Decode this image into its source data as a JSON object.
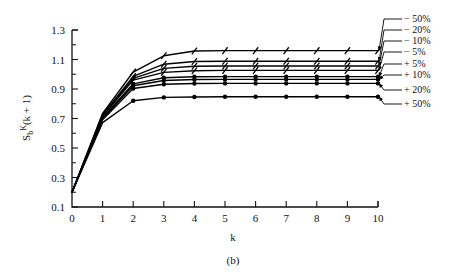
{
  "caption": "(b)",
  "chart_data": {
    "type": "line",
    "title": "",
    "xlabel": "k",
    "ylabel": "Sᵦᴷ(k + 1)",
    "ylabel_parts": {
      "base": "S",
      "sub": "b",
      "sup": "K",
      "tail": "(k + 1)"
    },
    "x": [
      0,
      1,
      2,
      3,
      4,
      5,
      6,
      7,
      8,
      9,
      10
    ],
    "xlim": [
      0,
      10
    ],
    "ylim": [
      0.1,
      1.3
    ],
    "xticks": [
      "0",
      "1",
      "2",
      "3",
      "4",
      "5",
      "6",
      "7",
      "8",
      "9",
      "10"
    ],
    "yticks": [
      "0.1",
      "0.3",
      "0.5",
      "0.7",
      "0.9",
      "1.1",
      "1.3"
    ],
    "ytick_minor_step": 0.1,
    "grid": false,
    "legend_position": "right-outside",
    "series": [
      {
        "name": "− 50%",
        "marker": "tick",
        "values": [
          0.2,
          0.735,
          1.015,
          1.125,
          1.158,
          1.16,
          1.16,
          1.16,
          1.16,
          1.16,
          1.16
        ]
      },
      {
        "name": "− 20%",
        "marker": "tick",
        "values": [
          0.2,
          0.725,
          0.985,
          1.068,
          1.086,
          1.088,
          1.088,
          1.088,
          1.088,
          1.088,
          1.088
        ]
      },
      {
        "name": "− 10%",
        "marker": "tick",
        "values": [
          0.2,
          0.72,
          0.972,
          1.04,
          1.054,
          1.056,
          1.056,
          1.056,
          1.056,
          1.056,
          1.056
        ]
      },
      {
        "name": "− 5%",
        "marker": "tick",
        "values": [
          0.2,
          0.715,
          0.96,
          1.013,
          1.024,
          1.026,
          1.026,
          1.026,
          1.026,
          1.026,
          1.026
        ]
      },
      {
        "name": "+ 5%",
        "marker": "dot",
        "values": [
          0.2,
          0.705,
          0.935,
          0.976,
          0.983,
          0.984,
          0.984,
          0.984,
          0.984,
          0.984,
          0.984
        ]
      },
      {
        "name": "+ 10%",
        "marker": "dot",
        "values": [
          0.2,
          0.7,
          0.922,
          0.958,
          0.964,
          0.965,
          0.965,
          0.965,
          0.965,
          0.965,
          0.965
        ]
      },
      {
        "name": "+ 20%",
        "marker": "dot",
        "values": [
          0.2,
          0.692,
          0.903,
          0.932,
          0.937,
          0.938,
          0.938,
          0.938,
          0.938,
          0.938,
          0.938
        ]
      },
      {
        "name": "+ 50%",
        "marker": "dot",
        "values": [
          0.2,
          0.672,
          0.82,
          0.843,
          0.846,
          0.847,
          0.847,
          0.847,
          0.847,
          0.847,
          0.847
        ]
      }
    ]
  }
}
